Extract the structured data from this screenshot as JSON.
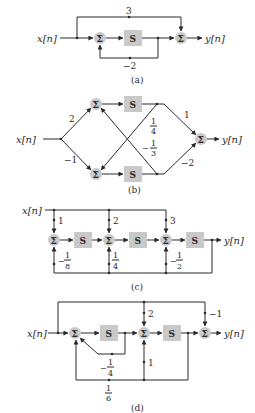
{
  "figure": {
    "colors": {
      "block_fill": "#c9c9c9",
      "line": "#2a2a2a",
      "background": "#ffffff"
    },
    "symbols": {
      "sum": "Σ",
      "delay": "S"
    },
    "panels": [
      {
        "id": "a",
        "caption": "(a)",
        "input": "x[n]",
        "output": "y[n]",
        "gains": {
          "feedforward": "3",
          "feedback": "−2"
        }
      },
      {
        "id": "b",
        "caption": "(b)",
        "input": "x[n]",
        "output": "y[n]",
        "gains": {
          "to_top": "2",
          "to_bottom": "−1",
          "cross_top_to_bottom": {
            "sign": "",
            "num": "1",
            "den": "4"
          },
          "cross_bottom_to_top": {
            "sign": "−",
            "num": "1",
            "den": "3"
          },
          "top_out": "1",
          "bottom_out": "−2"
        }
      },
      {
        "id": "c",
        "caption": "(c)",
        "input": "x[n]",
        "output": "y[n]",
        "gains": {
          "ff1": "1",
          "ff2": "2",
          "ff3": "3",
          "fb1": {
            "sign": "−",
            "num": "1",
            "den": "8"
          },
          "fb2": {
            "sign": "",
            "num": "1",
            "den": "4"
          },
          "fb3": {
            "sign": "−",
            "num": "1",
            "den": "2"
          }
        }
      },
      {
        "id": "d",
        "caption": "(d)",
        "input": "x[n]",
        "output": "y[n]",
        "gains": {
          "ff_mid": "2",
          "ff_out": "−1",
          "inner_fb": {
            "sign": "−",
            "num": "1",
            "den": "4"
          },
          "mid_up": "1",
          "outer_fb": {
            "sign": "",
            "num": "1",
            "den": "6"
          }
        }
      }
    ]
  }
}
